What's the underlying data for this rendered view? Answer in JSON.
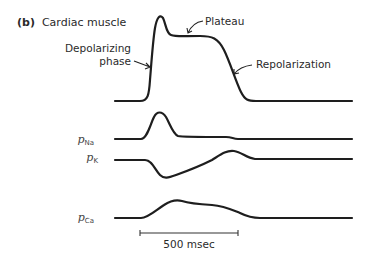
{
  "figure": {
    "panel_letter": "(b)",
    "title": "Cardiac muscle",
    "annotations": {
      "depolarizing_line1": "Depolarizing",
      "depolarizing_line2": "phase",
      "plateau": "Plateau",
      "repolarization": "Repolarization"
    },
    "traces": [
      {
        "id": "action-potential",
        "label": ""
      },
      {
        "id": "p-na",
        "label_main": "p",
        "label_sub": "Na"
      },
      {
        "id": "p-k",
        "label_main": "p",
        "label_sub": "K"
      },
      {
        "id": "p-ca",
        "label_main": "p",
        "label_sub": "Ca"
      }
    ],
    "scale_bar": {
      "label": "500 msec",
      "duration_ms": 500
    }
  },
  "colors": {
    "ink": "#1e1e1e",
    "background": "#ffffff"
  }
}
